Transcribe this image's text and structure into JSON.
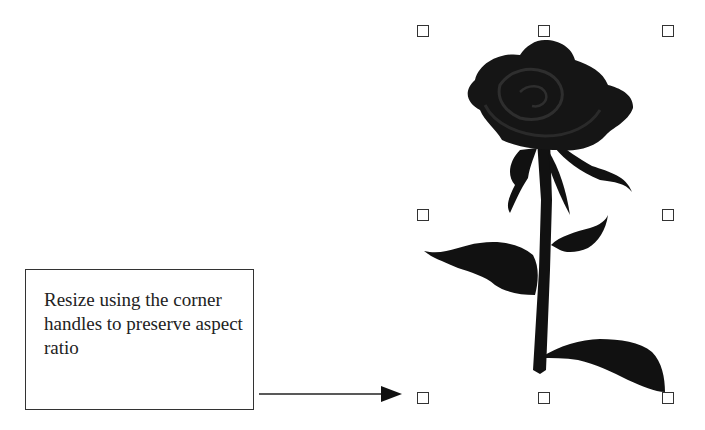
{
  "callout": {
    "text": "Resize using the corner handles to preserve aspect ratio"
  },
  "image": {
    "subject": "rose-clipart",
    "fill_color": "#111111",
    "petal_shade": "#2a2a2a"
  },
  "selection": {
    "handle_color": "#333333",
    "handles": [
      "top-left",
      "top-center",
      "top-right",
      "middle-left",
      "middle-right",
      "bottom-left",
      "bottom-center",
      "bottom-right"
    ]
  },
  "arrow": {
    "points_to": "bottom-left"
  }
}
